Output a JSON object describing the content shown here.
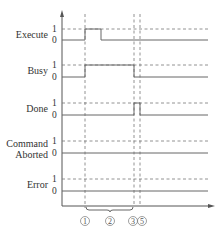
{
  "diagram": {
    "type": "timing-diagram",
    "signals": [
      {
        "name": "Execute",
        "label_lines": [
          "Execute"
        ],
        "high_label": "1",
        "low_label": "0",
        "transitions": [
          {
            "from_marker": "1",
            "to": "after-1",
            "level": 1
          }
        ]
      },
      {
        "name": "Busy",
        "label_lines": [
          "Busy"
        ],
        "high_label": "1",
        "low_label": "0",
        "transitions": [
          {
            "from_marker": "1",
            "to_marker": "3",
            "level": 1
          }
        ]
      },
      {
        "name": "Done",
        "label_lines": [
          "Done"
        ],
        "high_label": "1",
        "low_label": "0",
        "transitions": [
          {
            "from_marker": "3",
            "to_marker": "5",
            "level": 1
          }
        ]
      },
      {
        "name": "Command Aborted",
        "label_lines": [
          "Command",
          "Aborted"
        ],
        "high_label": "1",
        "low_label": "0",
        "transitions": []
      },
      {
        "name": "Error",
        "label_lines": [
          "Error"
        ],
        "high_label": "1",
        "low_label": "0",
        "transitions": []
      }
    ],
    "markers": [
      {
        "id": "1",
        "label": "①"
      },
      {
        "id": "2",
        "label": "②"
      },
      {
        "id": "3",
        "label": "③"
      },
      {
        "id": "5",
        "label": "⑤"
      }
    ],
    "bracket": {
      "from_marker": "1",
      "to_marker": "3",
      "label_marker": "2"
    }
  }
}
